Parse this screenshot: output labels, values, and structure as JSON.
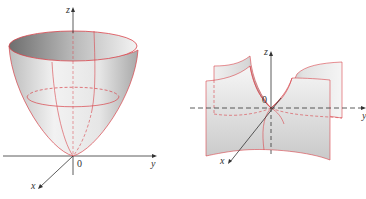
{
  "figures": [
    {
      "name": "elliptic-paraboloid",
      "axes": {
        "z_label": "z",
        "y_label": "y",
        "x_label": "x",
        "origin_label": "0"
      },
      "colors": {
        "trace": "#d9434a",
        "axis": "#333333",
        "surface_light": "#f4f4f4",
        "surface_dark": "#8a8a8a"
      }
    },
    {
      "name": "hyperbolic-paraboloid",
      "axes": {
        "z_label": "z",
        "y_label": "y",
        "x_label": "x",
        "origin_label": "0"
      },
      "colors": {
        "trace": "#d9434a",
        "axis": "#333333",
        "surface_light": "#f4f4f4",
        "surface_dark": "#8a8a8a"
      }
    }
  ]
}
